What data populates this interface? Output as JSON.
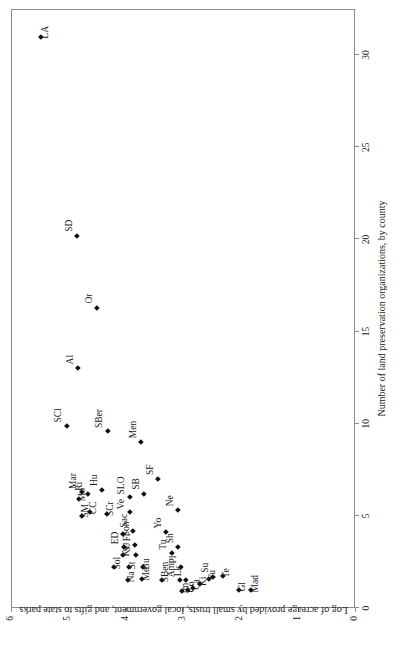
{
  "chart_data": {
    "type": "scatter",
    "title": "",
    "xlabel": "Number of land preservation organizations, by county",
    "ylabel": "Log of acreage provided by small trusts, local government, and gifts to state parks",
    "xlim": [
      0,
      32.5
    ],
    "ylim": [
      0,
      6
    ],
    "xticks": [
      0,
      5,
      10,
      15,
      20,
      25,
      30
    ],
    "xticklabels": [
      "0",
      "5",
      "10",
      "15",
      "20",
      "25",
      "30"
    ],
    "yticks": [
      0,
      1,
      2,
      3,
      4,
      5,
      6
    ],
    "yticklabels": [
      "0",
      "1",
      "2",
      "3",
      "4",
      "5",
      "6"
    ],
    "grid": false,
    "legend": false,
    "marker": "diamond",
    "marker_color": "#111111",
    "orientation": "rotated-90-ccw",
    "points": [
      {
        "label": "LA",
        "x": 31.0,
        "y": 5.47,
        "lx": -2,
        "ly": 9,
        "rot": true
      },
      {
        "label": "SD",
        "x": 20.2,
        "y": 4.85,
        "lx": 4,
        "ly": -3,
        "rot": true
      },
      {
        "label": "Or",
        "x": 16.3,
        "y": 4.5,
        "lx": 4,
        "ly": -3,
        "rot": true
      },
      {
        "label": "Al",
        "x": 13.0,
        "y": 4.83,
        "lx": 4,
        "ly": -3,
        "rot": true
      },
      {
        "label": "SCl",
        "x": 9.9,
        "y": 5.02,
        "lx": 3,
        "ly": -4,
        "rot": true
      },
      {
        "label": "SBer",
        "x": 9.6,
        "y": 4.3,
        "lx": 3,
        "ly": -4,
        "rot": true
      },
      {
        "label": "Men",
        "x": 9.0,
        "y": 3.74,
        "lx": 4,
        "ly": -3,
        "rot": true
      },
      {
        "label": "SF",
        "x": 7.0,
        "y": 3.44,
        "lx": 4,
        "ly": -3,
        "rot": true
      },
      {
        "label": "Mar",
        "x": 6.3,
        "y": 4.77,
        "lx": 3,
        "ly": -4,
        "rot": true
      },
      {
        "label": "Ri",
        "x": 6.2,
        "y": 4.66,
        "lx": 3,
        "ly": -4,
        "rot": true
      },
      {
        "label": "Hu",
        "x": 6.4,
        "y": 4.42,
        "lx": 4,
        "ly": -3,
        "rot": true
      },
      {
        "label": "Mo",
        "x": 5.9,
        "y": 4.82,
        "lx": -2,
        "ly": 8,
        "rot": true
      },
      {
        "label": "SLO",
        "x": 6.0,
        "y": 3.92,
        "lx": 3,
        "ly": -4,
        "rot": true
      },
      {
        "label": "SB",
        "x": 6.2,
        "y": 3.68,
        "lx": 4,
        "ly": -3,
        "rot": true
      },
      {
        "label": "SM",
        "x": 5.0,
        "y": 4.76,
        "lx": -2,
        "ly": 8,
        "rot": true
      },
      {
        "label": "CC",
        "x": 5.2,
        "y": 4.62,
        "lx": -2,
        "ly": 8,
        "rot": true
      },
      {
        "label": "SCr",
        "x": 5.1,
        "y": 4.33,
        "lx": -2,
        "ly": 8,
        "rot": true
      },
      {
        "label": "Ve",
        "x": 5.2,
        "y": 3.92,
        "lx": 3,
        "ly": -4,
        "rot": true
      },
      {
        "label": "Ne",
        "x": 5.3,
        "y": 3.08,
        "lx": 4,
        "ly": -3,
        "rot": true
      },
      {
        "label": "Son",
        "x": 4.0,
        "y": 4.05,
        "lx": -2,
        "ly": 8,
        "rot": true
      },
      {
        "label": "Sac",
        "x": 4.2,
        "y": 3.88,
        "lx": 3,
        "ly": -4,
        "rot": true
      },
      {
        "label": "Yo",
        "x": 4.1,
        "y": 3.3,
        "lx": 4,
        "ly": -3,
        "rot": true
      },
      {
        "label": "ED",
        "x": 3.3,
        "y": 4.03,
        "lx": 3,
        "ly": -4,
        "rot": true
      },
      {
        "label": "Fr",
        "x": 3.4,
        "y": 3.84,
        "lx": 4,
        "ly": -3,
        "rot": true
      },
      {
        "label": "Sh",
        "x": 3.3,
        "y": 3.08,
        "lx": 4,
        "ly": -3,
        "rot": true
      },
      {
        "label": "Ke",
        "x": 2.9,
        "y": 4.04,
        "lx": -2,
        "ly": 8,
        "rot": true
      },
      {
        "label": "SJ",
        "x": 2.9,
        "y": 3.82,
        "lx": 3,
        "ly": -4,
        "rot": true
      },
      {
        "label": "Tu",
        "x": 3.0,
        "y": 3.2,
        "lx": 3,
        "ly": -4,
        "rot": true
      },
      {
        "label": "Sol",
        "x": 2.2,
        "y": 4.2,
        "lx": -2,
        "ly": 8,
        "rot": true
      },
      {
        "label": "St",
        "x": 2.2,
        "y": 3.95,
        "lx": -2,
        "ly": 8,
        "rot": true
      },
      {
        "label": "Bu",
        "x": 2.2,
        "y": 3.7,
        "lx": -2,
        "ly": 8,
        "rot": true
      },
      {
        "label": "Pl",
        "x": 2.2,
        "y": 3.04,
        "lx": 4,
        "ly": -3,
        "rot": true
      },
      {
        "label": "Na",
        "x": 1.5,
        "y": 3.96,
        "lx": -2,
        "ly": 8,
        "rot": true
      },
      {
        "label": "Me",
        "x": 1.6,
        "y": 3.72,
        "lx": -2,
        "ly": 9,
        "rot": true
      },
      {
        "label": "SBen",
        "x": 1.5,
        "y": 3.36,
        "lx": -2,
        "ly": 8,
        "rot": true
      },
      {
        "label": "Am",
        "x": 1.5,
        "y": 3.05,
        "lx": 3,
        "ly": -4,
        "rot": true
      },
      {
        "label": "Lk",
        "x": 1.5,
        "y": 2.95,
        "lx": 4,
        "ly": -3,
        "rot": true
      },
      {
        "label": "Im",
        "x": 0.9,
        "y": 3.02,
        "lx": -2,
        "ly": 8,
        "rot": true
      },
      {
        "label": "Co",
        "x": 0.95,
        "y": 2.92,
        "lx": -2,
        "ly": 8,
        "rot": true
      },
      {
        "label": "Ca",
        "x": 1.1,
        "y": 2.82,
        "lx": -2,
        "ly": 8,
        "rot": true
      },
      {
        "label": "Ki",
        "x": 1.3,
        "y": 2.7,
        "lx": -2,
        "ly": 8,
        "rot": true
      },
      {
        "label": "Yu",
        "x": 1.6,
        "y": 2.55,
        "lx": -2,
        "ly": 8,
        "rot": true
      },
      {
        "label": "Su",
        "x": 1.7,
        "y": 2.48,
        "lx": 4,
        "ly": -3,
        "rot": true
      },
      {
        "label": "Te",
        "x": 1.75,
        "y": 2.3,
        "lx": -2,
        "ly": 8,
        "rot": true
      },
      {
        "label": "Gl",
        "x": 1.0,
        "y": 2.02,
        "lx": -2,
        "ly": 8,
        "rot": true
      },
      {
        "label": "Mad",
        "x": 0.95,
        "y": 1.82,
        "lx": -2,
        "ly": 9,
        "rot": true
      }
    ]
  }
}
